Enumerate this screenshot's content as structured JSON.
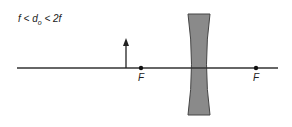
{
  "diagram": {
    "condition": {
      "left": "f < d",
      "subscript": "o",
      "right": " < 2f"
    },
    "optical_axis": {
      "x1": 17,
      "x2": 278,
      "y": 68,
      "color": "#333333"
    },
    "object_arrow": {
      "x": 126,
      "y_base": 68,
      "y_tip": 39,
      "color": "#222222"
    },
    "lens": {
      "type": "concave (diverging)",
      "center_x": 199,
      "top_y": 14,
      "bottom_y": 115,
      "edge_half_width": 11,
      "center_half_width": 4,
      "fill": "#8a8a8a",
      "stroke": "#444444"
    },
    "focal_points": [
      {
        "label": "F",
        "x": 141,
        "y": 68
      },
      {
        "label": "F",
        "x": 256,
        "y": 68
      }
    ]
  }
}
